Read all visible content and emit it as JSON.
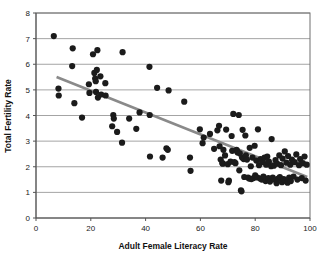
{
  "chart_data": {
    "type": "scatter",
    "title": "",
    "xlabel": "Adult Female Literacy Rate",
    "ylabel": "Total Fertility Rate",
    "xlim": [
      0,
      100
    ],
    "ylim": [
      0,
      8
    ],
    "xticks": [
      0,
      20,
      40,
      60,
      80,
      100
    ],
    "yticks": [
      0,
      1,
      2,
      3,
      4,
      5,
      6,
      7,
      8
    ],
    "xtick_labels": [
      "0",
      "20",
      "40",
      "60",
      "80",
      "100"
    ],
    "ytick_labels": [
      "0",
      "1",
      "2",
      "3",
      "4",
      "5",
      "6",
      "7",
      "8"
    ],
    "grid": "horizontal",
    "legend": "none",
    "marker_color": "#1b1b1b",
    "marker_size": 3.1,
    "trend_line": {
      "type": "linear-fit",
      "color": "#8a8a8a",
      "x_start": 7.5,
      "y_start": 5.5,
      "x_end": 99.0,
      "y_end": 1.6
    },
    "points": [
      [
        6.5,
        7.1
      ],
      [
        8.2,
        5.05
      ],
      [
        8.3,
        4.78
      ],
      [
        13.4,
        6.62
      ],
      [
        13.2,
        5.93
      ],
      [
        14.0,
        4.48
      ],
      [
        16.8,
        3.92
      ],
      [
        19.3,
        5.22
      ],
      [
        19.5,
        4.88
      ],
      [
        20.8,
        6.39
      ],
      [
        21.3,
        5.66
      ],
      [
        21.6,
        5.44
      ],
      [
        21.8,
        5.34
      ],
      [
        21.9,
        4.92
      ],
      [
        22.2,
        5.78
      ],
      [
        22.4,
        6.55
      ],
      [
        22.6,
        4.7
      ],
      [
        23.5,
        5.53
      ],
      [
        23.8,
        4.82
      ],
      [
        25.3,
        5.26
      ],
      [
        25.4,
        4.78
      ],
      [
        27.8,
        3.58
      ],
      [
        28.2,
        4.02
      ],
      [
        28.4,
        3.88
      ],
      [
        29.6,
        3.36
      ],
      [
        31.6,
        6.47
      ],
      [
        31.4,
        2.94
      ],
      [
        34.0,
        3.88
      ],
      [
        36.6,
        3.48
      ],
      [
        37.8,
        4.12
      ],
      [
        41.4,
        5.9
      ],
      [
        41.5,
        4.02
      ],
      [
        41.6,
        2.4
      ],
      [
        44.2,
        5.08
      ],
      [
        46.2,
        2.36
      ],
      [
        47.6,
        2.72
      ],
      [
        48.1,
        2.66
      ],
      [
        48.4,
        4.98
      ],
      [
        54.1,
        4.54
      ],
      [
        56.2,
        2.36
      ],
      [
        56.4,
        1.84
      ],
      [
        59.8,
        3.46
      ],
      [
        60.8,
        2.92
      ],
      [
        61.2,
        3.14
      ],
      [
        63.5,
        3.28
      ],
      [
        65.0,
        2.7
      ],
      [
        66.2,
        3.42
      ],
      [
        66.8,
        3.6
      ],
      [
        67.0,
        2.8
      ],
      [
        67.4,
        2.28
      ],
      [
        67.6,
        1.46
      ],
      [
        68.0,
        2.14
      ],
      [
        68.2,
        2.12
      ],
      [
        68.4,
        2.66
      ],
      [
        69.0,
        2.44
      ],
      [
        69.4,
        3.45
      ],
      [
        70.0,
        2.1
      ],
      [
        70.2,
        1.4
      ],
      [
        70.4,
        1.46
      ],
      [
        71.0,
        2.2
      ],
      [
        71.4,
        3.2
      ],
      [
        71.6,
        2.62
      ],
      [
        72.0,
        4.06
      ],
      [
        72.4,
        2.18
      ],
      [
        72.8,
        2.14
      ],
      [
        73.2,
        2.66
      ],
      [
        73.4,
        2.6
      ],
      [
        73.6,
        2.56
      ],
      [
        74.0,
        4.02
      ],
      [
        74.2,
        1.86
      ],
      [
        74.4,
        2.52
      ],
      [
        74.8,
        1.08
      ],
      [
        75.0,
        1.04
      ],
      [
        75.2,
        2.36
      ],
      [
        75.4,
        3.44
      ],
      [
        75.8,
        2.3
      ],
      [
        76.0,
        1.6
      ],
      [
        76.4,
        3.22
      ],
      [
        76.6,
        2.44
      ],
      [
        77.0,
        2.28
      ],
      [
        77.4,
        1.58
      ],
      [
        77.8,
        1.54
      ],
      [
        78.0,
        2.74
      ],
      [
        78.4,
        2.02
      ],
      [
        78.6,
        1.52
      ],
      [
        79.0,
        2.36
      ],
      [
        79.4,
        1.56
      ],
      [
        79.8,
        2.82
      ],
      [
        80.0,
        1.66
      ],
      [
        80.4,
        2.24
      ],
      [
        80.8,
        1.58
      ],
      [
        81.0,
        3.46
      ],
      [
        81.4,
        2.06
      ],
      [
        81.8,
        1.54
      ],
      [
        82.0,
        2.3
      ],
      [
        82.4,
        1.5
      ],
      [
        82.8,
        2.18
      ],
      [
        83.0,
        1.62
      ],
      [
        83.4,
        2.36
      ],
      [
        83.8,
        1.44
      ],
      [
        84.0,
        2.08
      ],
      [
        84.4,
        2.4
      ],
      [
        84.8,
        1.56
      ],
      [
        85.0,
        2.2
      ],
      [
        85.4,
        1.42
      ],
      [
        85.8,
        2.02
      ],
      [
        86.0,
        3.08
      ],
      [
        86.4,
        1.58
      ],
      [
        86.8,
        2.04
      ],
      [
        87.0,
        1.5
      ],
      [
        87.4,
        2.26
      ],
      [
        87.8,
        1.36
      ],
      [
        88.0,
        2.12
      ],
      [
        88.4,
        1.54
      ],
      [
        88.8,
        2.44
      ],
      [
        89.0,
        1.6
      ],
      [
        89.4,
        2.06
      ],
      [
        89.8,
        1.4
      ],
      [
        90.0,
        2.32
      ],
      [
        90.4,
        1.52
      ],
      [
        90.8,
        2.6
      ],
      [
        91.0,
        1.46
      ],
      [
        91.4,
        2.16
      ],
      [
        91.8,
        1.38
      ],
      [
        92.0,
        2.42
      ],
      [
        92.4,
        1.58
      ],
      [
        92.8,
        2.08
      ],
      [
        93.0,
        1.44
      ],
      [
        93.4,
        2.28
      ],
      [
        94.0,
        1.62
      ],
      [
        94.4,
        2.18
      ],
      [
        95.0,
        2.48
      ],
      [
        95.4,
        1.5
      ],
      [
        96.0,
        2.06
      ],
      [
        96.4,
        2.3
      ],
      [
        97.0,
        1.56
      ],
      [
        97.4,
        2.14
      ],
      [
        98.0,
        2.4
      ],
      [
        98.4,
        1.46
      ],
      [
        98.8,
        2.08
      ]
    ]
  },
  "plot_geometry": {
    "left": 36,
    "right": 310,
    "top": 13,
    "bottom": 218
  }
}
